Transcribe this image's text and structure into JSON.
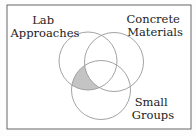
{
  "diagram": {
    "type": "venn",
    "sets": [
      {
        "name": "lab",
        "label_lines": [
          "Lab",
          "Approaches"
        ]
      },
      {
        "name": "concrete",
        "label_lines": [
          "Concrete",
          "Materials"
        ]
      },
      {
        "name": "small",
        "label_lines": [
          "Small",
          "Groups"
        ]
      }
    ],
    "highlighted_region": "Lab Approaches ∩ Small Groups, excluding Concrete Materials",
    "colors": {
      "outline": "#999999",
      "highlight": "#c4c4c4",
      "frame": "#666666",
      "text": "#222222"
    }
  }
}
